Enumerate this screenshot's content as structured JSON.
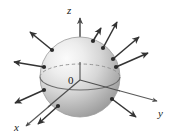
{
  "figure": {
    "background_color": "#ffffff",
    "width": 172,
    "height": 136,
    "axes": {
      "z": {
        "label": "z",
        "label_x": 67,
        "label_y": 12,
        "arrow": "up"
      },
      "y": {
        "label": "y",
        "label_x": 160,
        "label_y": 114,
        "arrow": "right"
      },
      "x": {
        "label": "x",
        "label_x": 16,
        "label_y": 129,
        "arrow": "down-left"
      },
      "color": "#4d4d4d"
    },
    "origin": {
      "label": "0",
      "label_x": 71,
      "label_y": 83,
      "x": 80,
      "y": 78
    },
    "sphere": {
      "center_x": 80,
      "center_y": 77,
      "radius": 40,
      "fill_light": "#f2f2f2",
      "fill_mid": "#c8c8c8",
      "fill_dark": "#9a9a9a",
      "outline_color": "#8c8c8c",
      "equator_solid_color": "#6b6b6b",
      "equator_dashed_color": "#8a8a8a"
    },
    "normal_vectors": {
      "count": 10,
      "color": "#3a3a3a",
      "dot_color": "#2b2b2b",
      "arrows": [
        {
          "id": "n1",
          "base_x": 52,
          "base_y": 50,
          "tip_x": 30,
          "tip_y": 32
        },
        {
          "id": "n2",
          "base_x": 44,
          "base_y": 67,
          "tip_x": 14,
          "tip_y": 62
        },
        {
          "id": "n3",
          "base_x": 44,
          "base_y": 90,
          "tip_x": 15,
          "tip_y": 103
        },
        {
          "id": "n4",
          "base_x": 58,
          "base_y": 106,
          "tip_x": 38,
          "tip_y": 124
        },
        {
          "id": "n5",
          "base_x": 103,
          "base_y": 48,
          "tip_x": 117,
          "tip_y": 22
        },
        {
          "id": "n6",
          "base_x": 113,
          "base_y": 59,
          "tip_x": 139,
          "tip_y": 37
        },
        {
          "id": "n7",
          "base_x": 116,
          "base_y": 67,
          "tip_x": 148,
          "tip_y": 53
        },
        {
          "id": "n8",
          "base_x": 112,
          "base_y": 99,
          "tip_x": 136,
          "tip_y": 117
        },
        {
          "id": "n9",
          "base_x": 93,
          "base_y": 41,
          "tip_x": 101,
          "tip_y": 30
        },
        {
          "id": "n10",
          "base_x": 118,
          "base_y": 83,
          "tip_x": 152,
          "tip_y": 82
        }
      ]
    }
  }
}
